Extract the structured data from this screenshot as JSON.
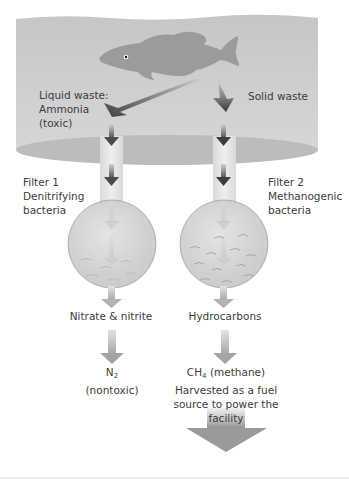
{
  "diagram": {
    "source": {
      "fish": "fish-icon",
      "left_output_label_line1": "Liquid waste:",
      "left_output_label_line2": "Ammonia",
      "left_output_label_line3": "(toxic)",
      "right_output_label": "Solid waste"
    },
    "filters": [
      {
        "name_line1": "Filter 1",
        "name_line2": "Denitrifying",
        "name_line3": "bacteria",
        "product": "Nitrate & nitrite",
        "final_product_formula": "N",
        "final_product_subscript": "2",
        "final_product_note": "(nontoxic)"
      },
      {
        "name_line1": "Filter 2",
        "name_line2": "Methanogenic",
        "name_line3": "bacteria",
        "product": "Hydrocarbons",
        "final_product_formula": "CH",
        "final_product_subscript": "4",
        "final_product_name": " (methane)",
        "final_product_note_line1": "Harvested as a fuel",
        "final_product_note_line2": "source to power the",
        "final_product_note_line3": "facility"
      }
    ],
    "colors": {
      "water": "#c9c9c9",
      "water_bottom": "#bdbdbd",
      "fish": "#9a9a9a",
      "arrow_dark": "#4a4a4a",
      "arrow_light": "#b5b5b5",
      "pipe": "#e6e6e6",
      "filter_fill": "#d4d4d4",
      "text": "#3b3b3b"
    }
  }
}
